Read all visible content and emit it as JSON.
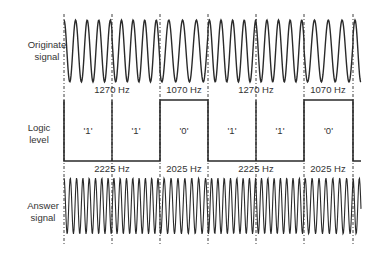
{
  "rows": {
    "originate": {
      "label_line1": "Originate",
      "label_line2": "signal"
    },
    "logic": {
      "label_line1": "Logic",
      "label_line2": "level"
    },
    "answer": {
      "label_line1": "Answer",
      "label_line2": "signal"
    }
  },
  "boundaries_x": [
    64,
    112,
    160,
    208,
    256,
    304,
    353
  ],
  "bits": [
    {
      "value": "'1'",
      "level": "high_mark"
    },
    {
      "value": "'1'",
      "level": "high_mark"
    },
    {
      "value": "'0'",
      "level": "space"
    },
    {
      "value": "'1'",
      "level": "high_mark"
    },
    {
      "value": "'1'",
      "level": "high_mark"
    },
    {
      "value": "'0'",
      "level": "space"
    }
  ],
  "originate_freq_labels": [
    {
      "text": "1270 Hz",
      "x": 112
    },
    {
      "text": "1070 Hz",
      "x": 184
    },
    {
      "text": "1270 Hz",
      "x": 256
    },
    {
      "text": "1070 Hz",
      "x": 328
    }
  ],
  "answer_freq_labels": [
    {
      "text": "2225 Hz",
      "x": 112
    },
    {
      "text": "2025 Hz",
      "x": 184
    },
    {
      "text": "2225 Hz",
      "x": 256
    },
    {
      "text": "2025 Hz",
      "x": 328
    }
  ],
  "frequencies": {
    "originate_mark": "1270 Hz",
    "originate_space": "1070 Hz",
    "answer_mark": "2225 Hz",
    "answer_space": "2025 Hz"
  },
  "colors": {
    "ink": "#2a2a2a",
    "background": "#ffffff"
  }
}
